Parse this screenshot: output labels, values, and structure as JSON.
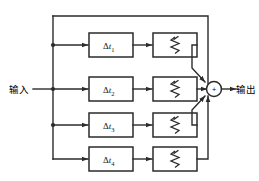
{
  "figure": {
    "type": "block-diagram",
    "background_color": "#ffffff",
    "line_color": "#2b2b2b"
  },
  "labels": {
    "input": "输入",
    "output": "输出",
    "sum_sign": "+"
  },
  "branches": [
    {
      "index": 1,
      "delay_symbol": "Δt",
      "delay_subscript": "1",
      "delay_label": "Δt₁",
      "attenuator": "variable-resistor"
    },
    {
      "index": 2,
      "delay_symbol": "Δt",
      "delay_subscript": "2",
      "delay_label": "Δt₂",
      "attenuator": "variable-resistor"
    },
    {
      "index": 3,
      "delay_symbol": "Δt",
      "delay_subscript": "3",
      "delay_label": "Δt₃",
      "attenuator": "variable-resistor"
    },
    {
      "index": 4,
      "delay_symbol": "Δt",
      "delay_subscript": "4",
      "delay_label": "Δt₄",
      "attenuator": "variable-resistor"
    }
  ],
  "nodes": {
    "summing_junction": "summing-junction",
    "input_bus": "input-distribution-bus",
    "tap_count": 4
  }
}
